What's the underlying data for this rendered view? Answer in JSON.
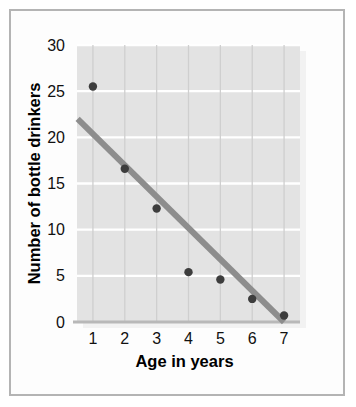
{
  "figure": {
    "border_color": "#b4b4b4",
    "page_background": "#ffffff",
    "panel_background": "#e3e3e3",
    "panel_shadow": "#f2f2f2"
  },
  "chart_data": {
    "type": "scatter",
    "title": "",
    "xlabel": "Age in years",
    "ylabel": "Number of bottle drinkers",
    "x": [
      1,
      2,
      3,
      4,
      5,
      6,
      7
    ],
    "values": [
      25.5,
      16.6,
      12.3,
      5.4,
      4.6,
      2.5,
      0.7
    ],
    "xlim": [
      0.5,
      7.5
    ],
    "ylim": [
      0,
      30
    ],
    "xticks": [
      1,
      2,
      3,
      4,
      5,
      6,
      7
    ],
    "xtick_labels": [
      "1",
      "2",
      "3",
      "4",
      "5",
      "6",
      "7"
    ],
    "yticks": [
      0,
      5,
      10,
      15,
      20,
      25,
      30
    ],
    "ytick_labels": [
      "0",
      "5",
      "10",
      "15",
      "20",
      "25",
      "30"
    ],
    "grid": {
      "horizontal": true,
      "horizontal_color": "#ffffff",
      "vertical": true,
      "vertical_color": "#cfcfcf"
    },
    "legend": null,
    "marker": {
      "shape": "circle",
      "color": "#3d3d3d",
      "radius": 4.2
    },
    "trendline": {
      "label": "line of best fit",
      "color": "#8d8d8d",
      "width": 6,
      "x_start": 0.52,
      "y_start": 22.0,
      "x_end": 7.0,
      "y_end": 0.0
    },
    "axis_line": {
      "color": "#b8b8b8",
      "width": 3
    }
  }
}
